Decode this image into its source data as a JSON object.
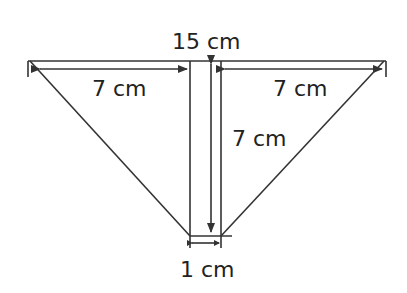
{
  "diagram": {
    "labels": {
      "top_width": "15 cm",
      "left_segment": "7 cm",
      "right_segment": "7 cm",
      "height": "7 cm",
      "bottom_width": "1 cm"
    },
    "colors": {
      "stroke": "#333333",
      "text": "#222222",
      "background": "#ffffff"
    }
  }
}
